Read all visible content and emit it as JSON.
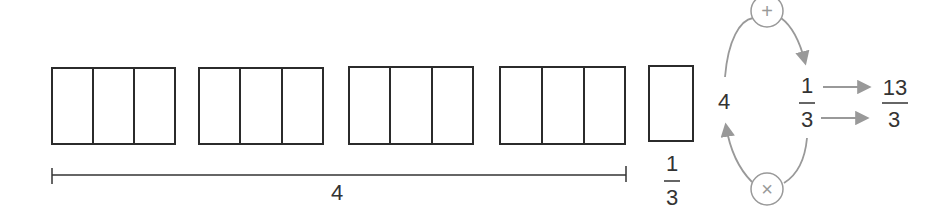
{
  "diagram": {
    "groups_count": 4,
    "parts_per_group": 3,
    "whole_label": "4",
    "single_part_fraction": {
      "numerator": "1",
      "denominator": "3"
    },
    "conversion": {
      "whole": "4",
      "fraction": {
        "numerator": "1",
        "denominator": "3"
      },
      "plus_symbol": "+",
      "times_symbol": "×",
      "result": {
        "numerator": "13",
        "denominator": "3"
      }
    },
    "colors": {
      "box_stroke": "#2b2b2b",
      "arrow": "#999999",
      "text": "#333333"
    }
  }
}
